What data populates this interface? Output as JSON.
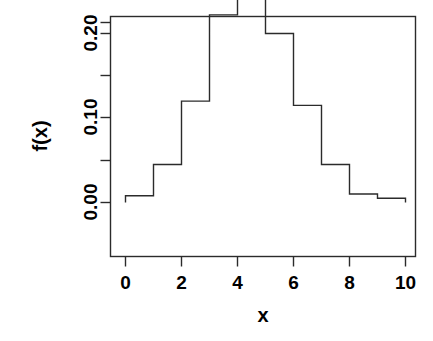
{
  "chart_data": {
    "type": "bar",
    "title": "",
    "subtitle": "",
    "xlabel": "x",
    "ylabel": "f(x)",
    "xlim": [
      0,
      10
    ],
    "ylim": [
      0.0,
      0.2675
    ],
    "grid": false,
    "legend": null,
    "bin_edges": [
      0,
      1,
      2,
      3,
      4,
      5,
      6,
      7,
      8,
      9,
      10
    ],
    "categories": [
      "0-1",
      "1-2",
      "2-3",
      "3-4",
      "4-5",
      "5-6",
      "6-7",
      "7-8",
      "8-9",
      "9-10"
    ],
    "values": [
      0.008,
      0.045,
      0.12,
      0.222,
      0.262,
      0.2,
      0.115,
      0.045,
      0.01,
      0.005
    ],
    "xticks": [
      0,
      2,
      4,
      6,
      8,
      10
    ],
    "xtick_labels": [
      "0",
      "2",
      "4",
      "6",
      "8",
      "10"
    ],
    "yticks": [
      0.0,
      0.05,
      0.1,
      0.15,
      0.2,
      0.25
    ],
    "ytick_labels": [
      "0.00",
      "",
      "0.10",
      "",
      "0.20",
      ""
    ],
    "ytick_labeled": [
      0.0,
      0.1,
      0.2
    ],
    "ytick_labeled_text": [
      "0.00",
      "0.10",
      "0.20"
    ],
    "line_color": "#2b2b2b",
    "background_color": "#ffffff",
    "fill_color": "none"
  },
  "axes": {
    "x_axis_title": "x",
    "y_axis_title": "f(x)",
    "x_tick_0": "0",
    "x_tick_2": "2",
    "x_tick_4": "4",
    "x_tick_6": "6",
    "x_tick_8": "8",
    "x_tick_10": "10",
    "y_tick_000": "0.00",
    "y_tick_010": "0.10",
    "y_tick_020": "0.20"
  }
}
